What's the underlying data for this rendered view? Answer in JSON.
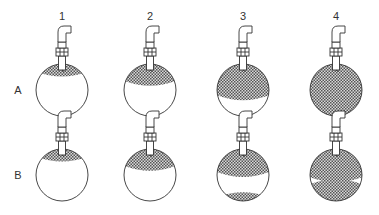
{
  "columns": [
    {
      "label": "1",
      "x": 62
    },
    {
      "label": "2",
      "x": 150
    },
    {
      "label": "3",
      "x": 243
    },
    {
      "label": "4",
      "x": 336
    }
  ],
  "rows": [
    {
      "label": "A",
      "cy": 90
    },
    {
      "label": "B",
      "cy": 175
    }
  ],
  "cells": {
    "A": [
      {
        "type": "top",
        "depth": 0.22
      },
      {
        "type": "top",
        "depth": 0.4
      },
      {
        "type": "top",
        "depth": 0.68
      },
      {
        "type": "full",
        "depth": 1.0
      }
    ],
    "B": [
      {
        "type": "top",
        "depth": 0.22
      },
      {
        "type": "top",
        "depth": 0.4
      },
      {
        "type": "split",
        "depth": 0.52,
        "bottom": 0.15
      },
      {
        "type": "split",
        "depth": 0.62,
        "bottom": 0.4
      }
    ]
  },
  "colors": {
    "stroke": "#333333",
    "hatch": "#555555"
  }
}
